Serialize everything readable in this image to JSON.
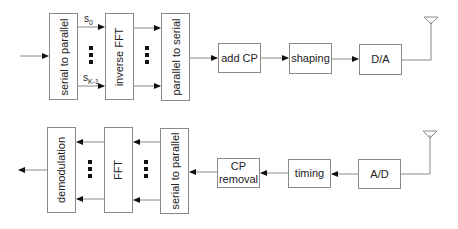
{
  "transmitter": {
    "blocks": [
      {
        "id": "tx-s2p",
        "label": "serial to parallel"
      },
      {
        "id": "tx-ifft",
        "label": "inverse FFT"
      },
      {
        "id": "tx-p2s",
        "label": "parallel to serial"
      },
      {
        "id": "tx-addcp",
        "label": "add CP"
      },
      {
        "id": "tx-shaping",
        "label": "shaping"
      },
      {
        "id": "tx-da",
        "label": "D/A"
      }
    ],
    "subcarrier_labels": {
      "first_base": "s",
      "first_sub": "0",
      "last_base": "s",
      "last_sub": "K-1"
    }
  },
  "receiver": {
    "blocks": [
      {
        "id": "rx-demod",
        "label": "demodulation"
      },
      {
        "id": "rx-fft",
        "label": "FFT"
      },
      {
        "id": "rx-s2p",
        "label": "serial to parallel"
      },
      {
        "id": "rx-cprem",
        "label": "CP removal"
      },
      {
        "id": "rx-timing",
        "label": "timing"
      },
      {
        "id": "rx-ad",
        "label": "A/D"
      }
    ]
  },
  "colors": {
    "line": "#8a8a8a",
    "arrow": "#111111",
    "box_border": "#8a8a8a"
  }
}
